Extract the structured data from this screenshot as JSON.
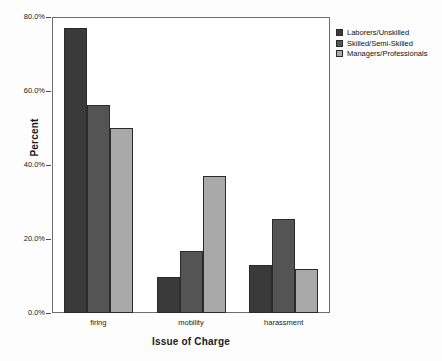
{
  "chart_data": {
    "type": "bar",
    "title": "",
    "xlabel": "Issue of Charge",
    "ylabel": "Percent",
    "categories": [
      "firing",
      "mobility",
      "harassment"
    ],
    "series": [
      {
        "name": "Laborers/Unskilled",
        "color": "#3a3a3a",
        "values": [
          76.9,
          9.8,
          13.1
        ]
      },
      {
        "name": "Skilled/Semi-Skilled",
        "color": "#545454",
        "values": [
          56.2,
          16.8,
          25.5
        ]
      },
      {
        "name": "Managers/Professionals",
        "color": "#a9a9a9",
        "values": [
          50.1,
          36.9,
          12.0
        ]
      }
    ],
    "ylim": [
      0,
      80
    ],
    "yticks": [
      0,
      20,
      40,
      60,
      80
    ],
    "ytick_labels": [
      "0.0%",
      "20.0%",
      "40.0%",
      "60.0%",
      "80.0%"
    ],
    "grid": false,
    "legend_position": "right-top"
  },
  "legend": {
    "entries": [
      {
        "label": "Laborers/Unskilled"
      },
      {
        "label": "Skilled/Semi-Skilled"
      },
      {
        "label": "Managers/Professionals"
      }
    ]
  }
}
